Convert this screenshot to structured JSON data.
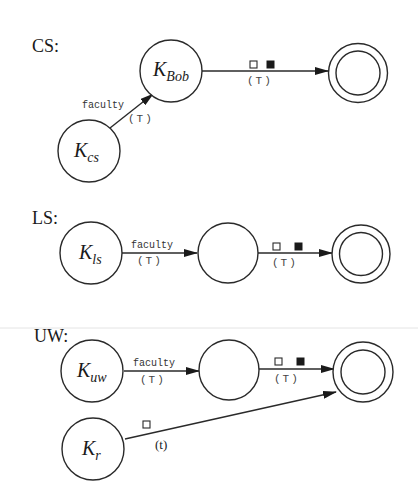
{
  "colors": {
    "ink": "#2a2a2a",
    "background": "#ffffff",
    "filled_square": "#1a1a1a"
  },
  "sections": {
    "cs": {
      "label": "CS:",
      "nodes": {
        "k_cs": {
          "main": "K",
          "sub": "cs"
        },
        "k_bob": {
          "main": "K",
          "sub": "Bob"
        },
        "accept": {
          "type": "double-circle"
        }
      },
      "edges": {
        "kcs_to_kbob": {
          "label": "faculty",
          "annotation": "(T)"
        },
        "kbob_to_accept": {
          "symbols": [
            "open-square",
            "filled-square"
          ],
          "annotation": "(T)"
        }
      }
    },
    "ls": {
      "label": "LS:",
      "nodes": {
        "k_ls": {
          "main": "K",
          "sub": "ls"
        },
        "middle": {
          "main": ""
        },
        "accept": {
          "type": "double-circle"
        }
      },
      "edges": {
        "kls_to_middle": {
          "label": "faculty",
          "annotation": "(T)"
        },
        "middle_to_accept": {
          "symbols": [
            "open-square",
            "filled-square"
          ],
          "annotation": "(T)"
        }
      }
    },
    "uw": {
      "label": "UW:",
      "nodes": {
        "k_uw": {
          "main": "K",
          "sub": "uw"
        },
        "middle": {
          "main": ""
        },
        "accept": {
          "type": "double-circle"
        },
        "k_r": {
          "main": "K",
          "sub": "r"
        }
      },
      "edges": {
        "kuw_to_middle": {
          "label": "faculty",
          "annotation": "(T)"
        },
        "middle_to_accept": {
          "symbols": [
            "open-square",
            "filled-square"
          ],
          "annotation": "(T)"
        },
        "kr_to_accept": {
          "symbols": [
            "open-square"
          ],
          "annotation": "(t)"
        }
      }
    }
  }
}
